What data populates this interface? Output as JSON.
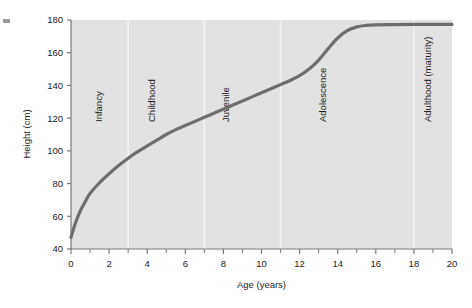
{
  "chart_data": {
    "type": "line",
    "title": "",
    "xlabel": "Age (years)",
    "ylabel": "Height (cm)",
    "xlim": [
      0,
      20
    ],
    "ylim": [
      40,
      180
    ],
    "grid": false,
    "legend": "none",
    "x_ticks": [
      0,
      2,
      4,
      6,
      8,
      10,
      12,
      14,
      16,
      18,
      20
    ],
    "x_tick_labels": [
      "0",
      "2",
      "4",
      "6",
      "8",
      "10",
      "12",
      "14",
      "16",
      "18",
      "20"
    ],
    "x_minor_ticks": [
      1,
      3,
      5,
      7,
      9,
      11,
      13,
      15,
      17,
      19
    ],
    "y_ticks": [
      40,
      60,
      80,
      100,
      120,
      140,
      160,
      180
    ],
    "y_tick_labels": [
      "40",
      "60",
      "80",
      "100",
      "120",
      "140",
      "160",
      "180"
    ],
    "series": [
      {
        "name": "Height",
        "color": "#6e6e6e",
        "x": [
          0.0,
          0.15,
          0.3,
          0.5,
          0.75,
          1.0,
          1.5,
          2.0,
          2.5,
          3.0,
          3.5,
          4.0,
          4.5,
          5.0,
          5.5,
          6.0,
          6.5,
          7.0,
          7.5,
          8.0,
          8.5,
          9.0,
          9.5,
          10.0,
          10.5,
          11.0,
          11.5,
          12.0,
          12.5,
          13.0,
          13.5,
          14.0,
          14.5,
          15.0,
          15.5,
          16.0,
          17.0,
          18.0,
          19.0,
          20.0
        ],
        "y": [
          47.0,
          53.0,
          58.0,
          63.5,
          69.0,
          74.0,
          80.5,
          86.0,
          91.0,
          95.5,
          99.5,
          103.0,
          106.5,
          110.0,
          113.0,
          115.5,
          118.0,
          120.5,
          123.0,
          125.5,
          128.0,
          130.5,
          133.0,
          135.5,
          138.0,
          140.5,
          143.0,
          146.0,
          150.0,
          155.5,
          162.5,
          169.0,
          173.5,
          175.8,
          176.7,
          177.0,
          177.2,
          177.3,
          177.3,
          177.3
        ]
      }
    ],
    "stage_bands": [
      {
        "label": "Infancy",
        "start": 0,
        "end": 3,
        "label_age": 1.6
      },
      {
        "label": "Childhood",
        "start": 3,
        "end": 7,
        "label_age": 4.4
      },
      {
        "label": "Juvenile",
        "start": 7,
        "end": 11,
        "label_age": 8.3
      },
      {
        "label": "Adolescence",
        "start": 11,
        "end": 18,
        "label_age": 13.4
      },
      {
        "label": "Adulthood (maturity)",
        "start": 18,
        "end": 20,
        "label_age": 18.9
      }
    ],
    "colors": {
      "plot_background": "#e2e2e2",
      "curve": "#6e6e6e",
      "axis": "#7a7a7a",
      "separator": "#f4f4f4",
      "text": "#1c1c1c",
      "page_background": "#ffffff"
    }
  }
}
